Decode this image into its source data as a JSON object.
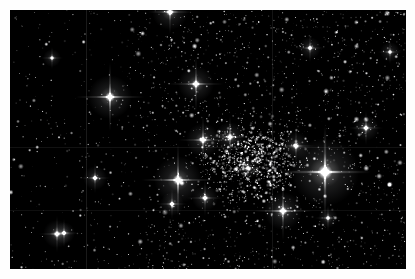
{
  "image": {
    "subject": "open star cluster in dense Milky Way star field",
    "type": "astronomical photograph",
    "width": 415,
    "height": 279,
    "border_width_px": 10,
    "border_color": "#fefefe",
    "sky_background_color": "#000000",
    "star_color": "#ffffff",
    "field_left": 10,
    "field_top": 10,
    "field_width": 396,
    "field_height": 259
  },
  "scene": {
    "description": "Dense white star field on black sky. A rich concentration of bright cluster members occupies the centre and centre-right. The left third of the frame is noticeably sparser and darker. Several very bright stars show four-point diffraction spikes and soft circular halos.",
    "cluster_center_x": 252,
    "cluster_center_y": 160,
    "cluster_radius": 115,
    "background_star_count": 2600,
    "cluster_star_count": 900
  },
  "bright_stars": [
    {
      "name": "brightest-star",
      "x": 325,
      "y": 172,
      "radius": 7.5,
      "glow": 34,
      "spike": 46,
      "brightness": 1.0
    },
    {
      "name": "bright-star-center",
      "x": 178,
      "y": 180,
      "radius": 5.4,
      "glow": 24,
      "spike": 36,
      "brightness": 0.92
    },
    {
      "name": "bright-star-upper-left",
      "x": 110,
      "y": 97,
      "radius": 5.0,
      "glow": 22,
      "spike": 34,
      "brightness": 0.9
    },
    {
      "name": "bright-star-lower-mid",
      "x": 283,
      "y": 211,
      "radius": 4.4,
      "glow": 19,
      "spike": 29,
      "brightness": 0.85
    },
    {
      "name": "bright-star-upper-mid",
      "x": 196,
      "y": 84,
      "radius": 4.2,
      "glow": 18,
      "spike": 27,
      "brightness": 0.84
    },
    {
      "name": "bright-star-cluster-a",
      "x": 203,
      "y": 140,
      "radius": 4.0,
      "glow": 17,
      "spike": 24,
      "brightness": 0.82
    },
    {
      "name": "bright-star-cluster-b",
      "x": 230,
      "y": 137,
      "radius": 3.7,
      "glow": 15,
      "spike": 21,
      "brightness": 0.78
    },
    {
      "name": "bright-star-top-edge",
      "x": 170,
      "y": 12,
      "radius": 4.0,
      "glow": 18,
      "spike": 22,
      "brightness": 0.8
    },
    {
      "name": "bright-star-right",
      "x": 296,
      "y": 146,
      "radius": 3.4,
      "glow": 14,
      "spike": 19,
      "brightness": 0.76
    },
    {
      "name": "bright-star-lower-left",
      "x": 57,
      "y": 234,
      "radius": 3.4,
      "glow": 14,
      "spike": 18,
      "brightness": 0.76
    },
    {
      "name": "bright-star-lower-left-2",
      "x": 64,
      "y": 233,
      "radius": 2.8,
      "glow": 11,
      "spike": 14,
      "brightness": 0.7
    },
    {
      "name": "bright-star-mid-left",
      "x": 95,
      "y": 178,
      "radius": 3.0,
      "glow": 12,
      "spike": 15,
      "brightness": 0.72
    },
    {
      "name": "bright-star-far-right",
      "x": 366,
      "y": 128,
      "radius": 3.2,
      "glow": 13,
      "spike": 17,
      "brightness": 0.74
    },
    {
      "name": "bright-star-bottom-mid",
      "x": 205,
      "y": 198,
      "radius": 3.3,
      "glow": 13,
      "spike": 18,
      "brightness": 0.75
    },
    {
      "name": "bright-star-bottom-c",
      "x": 172,
      "y": 204,
      "radius": 3.0,
      "glow": 12,
      "spike": 15,
      "brightness": 0.72
    },
    {
      "name": "bright-star-upper-right",
      "x": 310,
      "y": 48,
      "radius": 2.8,
      "glow": 11,
      "spike": 14,
      "brightness": 0.7
    },
    {
      "name": "bright-star-right-low",
      "x": 328,
      "y": 218,
      "radius": 2.6,
      "glow": 10,
      "spike": 13,
      "brightness": 0.68
    },
    {
      "name": "bright-star-mid-c",
      "x": 248,
      "y": 168,
      "radius": 2.7,
      "glow": 11,
      "spike": 13,
      "brightness": 0.69
    },
    {
      "name": "bright-star-left-upper",
      "x": 52,
      "y": 58,
      "radius": 2.4,
      "glow": 9,
      "spike": 11,
      "brightness": 0.65
    },
    {
      "name": "bright-star-edge-right",
      "x": 390,
      "y": 52,
      "radius": 2.5,
      "glow": 10,
      "spike": 12,
      "brightness": 0.66
    }
  ],
  "artifacts": {
    "scan_lines": [
      {
        "name": "vertical-scan-line-left",
        "orientation": "vertical",
        "position": 86,
        "opacity": 0.1
      },
      {
        "name": "vertical-scan-line-mid",
        "orientation": "vertical",
        "position": 272,
        "opacity": 0.08
      },
      {
        "name": "horizontal-scan-line-mid",
        "orientation": "horizontal",
        "position": 147,
        "opacity": 0.07
      },
      {
        "name": "horizontal-scan-line-low",
        "orientation": "horizontal",
        "position": 210,
        "opacity": 0.06
      }
    ]
  },
  "chart_data": {
    "type": "scatter",
    "xlabel": "",
    "ylabel": "",
    "note": "positions in frame pixel coordinates; brightness 0-1 relative flux"
  }
}
